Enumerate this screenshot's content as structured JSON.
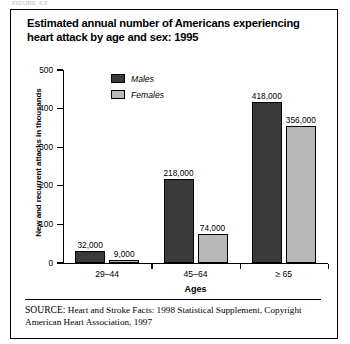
{
  "figure_caption_partial": "FIGURE 4.2",
  "title": "Estimated annual number of Americans experiencing heart attack by age and sex: 1995",
  "source_note_line1": "Heart and Stroke Facts: 1998 Statistical Supplement,",
  "source_note_line2": "Copyright American Heart Association, 1997",
  "source_prefix": "SOURCE:",
  "colors": {
    "males": "#3a3a3a",
    "females": "#b8b8b8",
    "axis": "#000000",
    "background": "#ffffff"
  },
  "chart_data": {
    "type": "bar",
    "title": "Estimated annual number of Americans experiencing heart attack by age and sex: 1995",
    "xlabel": "Ages",
    "ylabel": "New and recurrent attacks in thousands",
    "categories": [
      "29–44",
      "45–64",
      "≥ 65"
    ],
    "ylim": [
      0,
      500
    ],
    "yticks": [
      0,
      100,
      200,
      300,
      400,
      500
    ],
    "ytick_labels": [
      "0",
      "100",
      "200",
      "300",
      "400",
      "500"
    ],
    "grid": false,
    "legend_position": "top-center",
    "units": "thousands",
    "series": [
      {
        "name": "Males",
        "color": "#3a3a3a",
        "values": [
          32,
          218,
          418
        ],
        "labels": [
          "32,000",
          "218,000",
          "418,000"
        ]
      },
      {
        "name": "Females",
        "color": "#b8b8b8",
        "values": [
          9,
          74,
          356
        ],
        "labels": [
          "9,000",
          "74,000",
          "356,000"
        ]
      }
    ]
  }
}
